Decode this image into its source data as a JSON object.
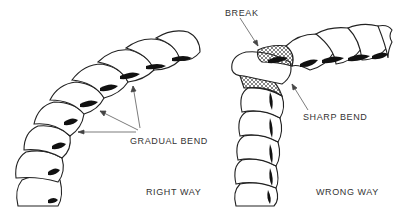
{
  "figure": {
    "panels": [
      {
        "id": "right-way",
        "caption": "RIGHT WAY",
        "callout": "GRADUAL BEND",
        "callout_arrow_count": 3
      },
      {
        "id": "wrong-way",
        "caption": "WRONG WAY",
        "callouts": [
          "BREAK",
          "SHARP BEND"
        ]
      }
    ],
    "colors": {
      "line": "#222222",
      "background": "#ffffff",
      "shadow": "#111111"
    }
  }
}
